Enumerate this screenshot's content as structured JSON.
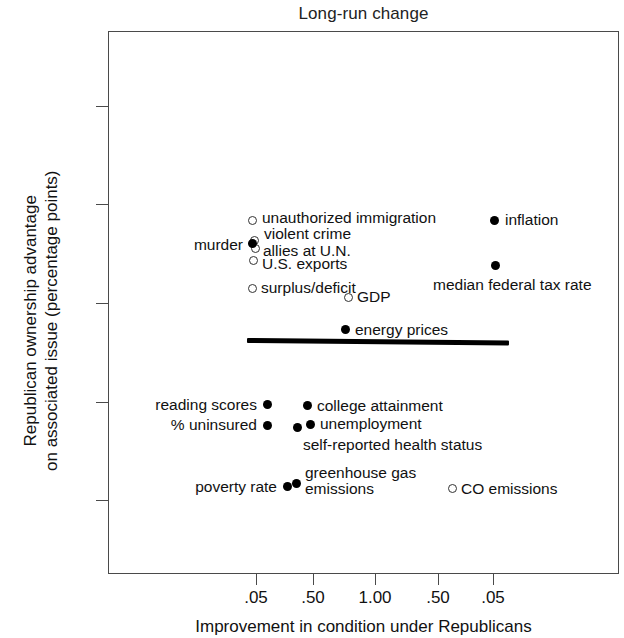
{
  "chart_data": {
    "type": "scatter",
    "title": "Long-run change",
    "xlabel": "Improvement in condition under Republicans",
    "ylabel_line1": "Republican ownership advantage",
    "ylabel_line2": "on associated issue (percentage points)",
    "xtick_labels": [
      ".05",
      ".50",
      "1.00",
      ".50",
      ".05"
    ],
    "xtick_px": [
      256,
      313,
      375,
      438,
      493
    ],
    "ytick_labels": [
      "20",
      "10",
      "0",
      "−10",
      "−20"
    ],
    "ytick_values": [
      20,
      10,
      0,
      -10,
      -20
    ],
    "ylim": [
      -26,
      25
    ],
    "grid": false,
    "legend": "none",
    "marker_note": "open circle = not statistically significant; filled circle = significant",
    "annotations": [
      {
        "name": "trend-line",
        "type": "horizontal-reference-line",
        "y_value": -3.8
      }
    ],
    "points": [
      {
        "label": "unauthorized immigration",
        "x_px": 252,
        "y_value": 8.4,
        "marker": "open",
        "label_side": "right",
        "label_dx": 10,
        "label_dy": -2
      },
      {
        "label": "violent crime",
        "x_px": 254,
        "y_value": 6.3,
        "marker": "open",
        "label_side": "right",
        "label_dx": 10,
        "label_dy": -7
      },
      {
        "label": "allies at U.N.",
        "x_px": 255,
        "y_value": 5.5,
        "marker": "open",
        "label_side": "right",
        "label_dx": 8,
        "label_dy": 2
      },
      {
        "label": "murder",
        "x_px": 252,
        "y_value": 6.0,
        "marker": "filled",
        "label_side": "left",
        "label_dx": -9,
        "label_dy": 1
      },
      {
        "label": "U.S. exports",
        "x_px": 253,
        "y_value": 4.3,
        "marker": "open",
        "label_side": "right",
        "label_dx": 9,
        "label_dy": 3
      },
      {
        "label": "surplus/deficit",
        "x_px": 252,
        "y_value": 1.5,
        "marker": "open",
        "label_side": "right",
        "label_dx": 9,
        "label_dy": 0
      },
      {
        "label": "GDP",
        "x_px": 348,
        "y_value": 0.6,
        "marker": "open",
        "label_side": "right",
        "label_dx": 9,
        "label_dy": 0
      },
      {
        "label": "inflation",
        "x_px": 494,
        "y_value": 8.4,
        "marker": "filled",
        "label_side": "right",
        "label_dx": 11,
        "label_dy": 0
      },
      {
        "label": "median federal tax rate",
        "x_px": 495,
        "y_value": 3.8,
        "marker": "filled",
        "label_side": "right",
        "label_dx": -62,
        "label_dy": 20
      },
      {
        "label": "energy prices",
        "x_px": 345,
        "y_value": -2.7,
        "marker": "filled",
        "label_side": "right",
        "label_dx": 10,
        "label_dy": 0
      },
      {
        "label": "reading scores",
        "x_px": 267,
        "y_value": -10.3,
        "marker": "filled",
        "label_side": "left",
        "label_dx": -10,
        "label_dy": 0
      },
      {
        "label": "college attainment",
        "x_px": 307,
        "y_value": -10.4,
        "marker": "filled",
        "label_side": "right",
        "label_dx": 10,
        "label_dy": 0
      },
      {
        "label": "% uninsured",
        "x_px": 267,
        "y_value": -12.4,
        "marker": "filled",
        "label_side": "left",
        "label_dx": -10,
        "label_dy": 0
      },
      {
        "label": "unemployment",
        "x_px": 310,
        "y_value": -12.3,
        "marker": "filled",
        "label_side": "right",
        "label_dx": 10,
        "label_dy": 0
      },
      {
        "label": "self-reported health status",
        "x_px": 297,
        "y_value": -12.6,
        "marker": "filled",
        "label_side": "right",
        "label_dx": 6,
        "label_dy": 18
      },
      {
        "label": "poverty rate",
        "x_px": 287,
        "y_value": -18.6,
        "marker": "filled",
        "label_side": "left",
        "label_dx": -10,
        "label_dy": 0
      },
      {
        "label": "greenhouse gas\nemissions",
        "x_px": 296,
        "y_value": -18.3,
        "marker": "filled",
        "label_side": "right",
        "label_dx": 9,
        "label_dy": -2
      },
      {
        "label": "CO emissions",
        "x_px": 452,
        "y_value": -18.8,
        "marker": "open",
        "label_side": "right",
        "label_dx": 9,
        "label_dy": 0
      }
    ]
  }
}
